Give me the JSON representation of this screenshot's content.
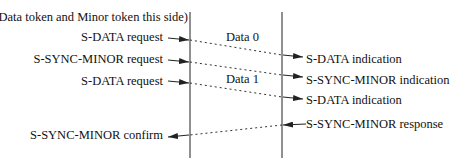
{
  "diagram": {
    "type": "sequence",
    "side_note": "(Data token and Minor token this side)",
    "left_events": [
      {
        "label": "S-DATA request",
        "y": 40
      },
      {
        "label": "S-SYNC-MINOR request",
        "y": 62
      },
      {
        "label": "S-DATA request",
        "y": 83
      },
      {
        "label": "S-SYNC-MINOR confirm",
        "y": 135
      }
    ],
    "right_events": [
      {
        "label": "S-DATA indication",
        "y": 55
      },
      {
        "label": "S-SYNC-MINOR indication",
        "y": 75
      },
      {
        "label": "S-DATA indication",
        "y": 97
      },
      {
        "label": "S-SYNC-MINOR response",
        "y": 125
      }
    ],
    "messages": [
      {
        "label": "Data 0",
        "from": "left",
        "to": "right"
      },
      {
        "label": "",
        "from": "left",
        "to": "right"
      },
      {
        "label": "Data 1",
        "from": "left",
        "to": "right"
      },
      {
        "label": "",
        "from": "right",
        "to": "left"
      }
    ],
    "colors": {
      "line": "#222222",
      "text": "#111111",
      "background": "#ffffff"
    }
  }
}
